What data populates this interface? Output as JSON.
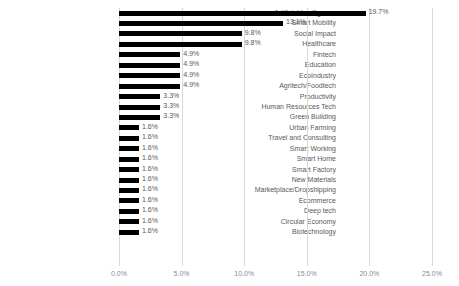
{
  "chart_data": {
    "type": "bar",
    "orientation": "horizontal",
    "title": "",
    "xlabel": "",
    "ylabel": "",
    "xlim": [
      0,
      25
    ],
    "xticks": [
      "0.0%",
      "5.0%",
      "10.0%",
      "15.0%",
      "20.0%",
      "25.0%"
    ],
    "xtick_values": [
      0,
      5,
      10,
      15,
      20,
      25
    ],
    "grid": true,
    "legend": false,
    "bar_color": "#000000",
    "label_color": "#595959",
    "grid_color": "#d9d9d9",
    "categories": [
      "Artificial Intelligence",
      "Smart Mobility",
      "Social Impact",
      "Healthcare",
      "Fintech",
      "Education",
      "EcoIndustry",
      "Agritech/Foodtech",
      "Productivity",
      "Human Resources Tech",
      "Green Building",
      "Urban Farming",
      "Travel and Consulting",
      "Smart Working",
      "Smart Home",
      "Smart Factory",
      "New Materials",
      "Marketplace/Dropshipping",
      "Ecommerce",
      "Deep tech",
      "Circular Economy",
      "Biotechnology"
    ],
    "values": [
      19.7,
      13.1,
      9.8,
      9.8,
      4.9,
      4.9,
      4.9,
      4.9,
      3.3,
      3.3,
      3.3,
      1.6,
      1.6,
      1.6,
      1.6,
      1.6,
      1.6,
      1.6,
      1.6,
      1.6,
      1.6,
      1.6
    ],
    "data_labels": [
      "19.7%",
      "13.1%",
      "9.8%",
      "9.8%",
      "4.9%",
      "4.9%",
      "4.9%",
      "4.9%",
      "3.3%",
      "3.3%",
      "3.3%",
      "1.6%",
      "1.6%",
      "1.6%",
      "1.6%",
      "1.6%",
      "1.6%",
      "1.6%",
      "1.6%",
      "1.6%",
      "1.6%",
      "1.6%"
    ]
  }
}
